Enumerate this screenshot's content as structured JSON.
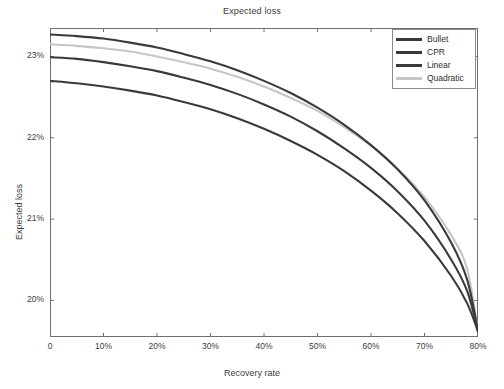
{
  "chart_data": {
    "type": "line",
    "title": "Expected loss",
    "xlabel": "Recovery rate",
    "ylabel": "Expected loss",
    "xlim": [
      0,
      80
    ],
    "ylim": [
      19.55,
      23.35
    ],
    "grid": false,
    "legend_position": "top-right",
    "xticks": [
      0,
      10,
      20,
      30,
      40,
      50,
      60,
      70,
      80
    ],
    "xtick_labels": [
      "0",
      "10%",
      "20%",
      "30%",
      "40%",
      "50%",
      "60%",
      "70%",
      "80%"
    ],
    "yticks": [
      23,
      22,
      21,
      20
    ],
    "ytick_labels": [
      "23%",
      "22%",
      "21%",
      "20%"
    ],
    "x": [
      0,
      5,
      10,
      15,
      20,
      25,
      30,
      35,
      40,
      45,
      50,
      55,
      60,
      65,
      70,
      75,
      78,
      80
    ],
    "series": [
      {
        "name": "Bullet",
        "color": "#3a3a3a",
        "values": [
          23.27,
          23.25,
          23.22,
          23.17,
          23.11,
          23.03,
          22.94,
          22.83,
          22.7,
          22.55,
          22.37,
          22.16,
          21.91,
          21.61,
          21.23,
          20.71,
          20.25,
          19.62
        ]
      },
      {
        "name": "CPR",
        "color": "#3a3a3a",
        "values": [
          22.7,
          22.67,
          22.63,
          22.58,
          22.52,
          22.44,
          22.35,
          22.24,
          22.11,
          21.96,
          21.79,
          21.59,
          21.35,
          21.07,
          20.73,
          20.3,
          19.96,
          19.62
        ]
      },
      {
        "name": "Linear",
        "color": "#3a3a3a",
        "values": [
          22.99,
          22.97,
          22.93,
          22.88,
          22.82,
          22.74,
          22.65,
          22.54,
          22.41,
          22.26,
          22.08,
          21.87,
          21.63,
          21.34,
          20.98,
          20.5,
          20.11,
          19.62
        ]
      },
      {
        "name": "Quadratic",
        "color": "#c6c6c6",
        "values": [
          23.15,
          23.13,
          23.1,
          23.06,
          23.0,
          22.93,
          22.85,
          22.75,
          22.63,
          22.49,
          22.33,
          22.13,
          21.9,
          21.62,
          21.27,
          20.8,
          20.38,
          19.62
        ]
      }
    ]
  },
  "legend": {
    "items": [
      {
        "label": "Bullet"
      },
      {
        "label": "CPR"
      },
      {
        "label": "Linear"
      },
      {
        "label": "Quadratic"
      }
    ]
  }
}
